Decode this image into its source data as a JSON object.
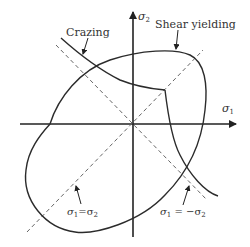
{
  "diagram": {
    "axes": {
      "x_label": "σ",
      "x_sub": "1",
      "y_label": "σ",
      "y_sub": "2"
    },
    "labels": {
      "crazing": "Crazing",
      "shear_yielding": "Shear yielding",
      "equal_biaxial_main": "σ",
      "equal_biaxial_sub1": "1",
      "equal_biaxial_eq": "=σ",
      "equal_biaxial_sub2": "2",
      "pure_shear_main": "σ",
      "pure_shear_sub1": "1",
      "pure_shear_eq": " = −σ",
      "pure_shear_sub2": "2"
    },
    "colors": {
      "line": "#2b2b2b",
      "dashed": "#555555",
      "text": "#333333"
    }
  }
}
